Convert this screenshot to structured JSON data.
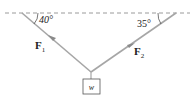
{
  "diagram": {
    "type": "force-diagram",
    "angle_left": "40°",
    "angle_right": "35°",
    "force_left": {
      "symbol": "F",
      "subscript": "1"
    },
    "force_right": {
      "symbol": "F",
      "subscript": "2"
    },
    "weight_label": "w",
    "colors": {
      "rope": "#a6a6a6",
      "dashed": "#9a9a9a",
      "text": "#222222"
    }
  }
}
